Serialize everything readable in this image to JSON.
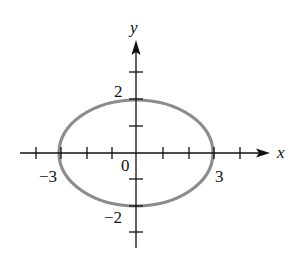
{
  "diagram": {
    "axes": {
      "x_label": "x",
      "y_label": "y",
      "x_range": [
        -4,
        4
      ],
      "y_range": [
        -3,
        3
      ],
      "x_ticks": [
        -4,
        -3,
        -2,
        -1,
        1,
        2,
        3,
        4
      ],
      "y_ticks": [
        -3,
        -2,
        -1,
        1,
        2,
        3
      ]
    },
    "tick_labels": {
      "origin": "0",
      "x_neg": "−3",
      "x_pos": "3",
      "y_pos": "2",
      "y_neg": "−2"
    },
    "ellipse": {
      "center": [
        0,
        0
      ],
      "semi_major_x": 3,
      "semi_minor_y": 2,
      "stroke_color": "#8c8c8c"
    },
    "colors": {
      "axis": "#111111",
      "background": "#ffffff",
      "curve": "#8c8c8c"
    }
  }
}
